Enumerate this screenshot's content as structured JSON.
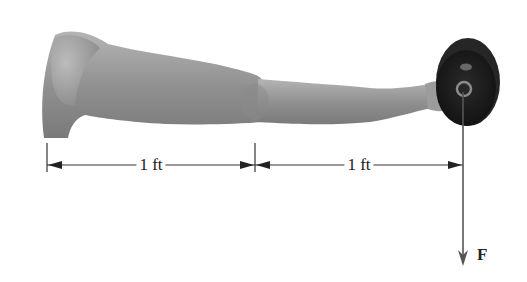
{
  "diagram": {
    "dimensions": [
      {
        "label": "1 ft",
        "from": "shoulder",
        "to": "elbow"
      },
      {
        "label": "1 ft",
        "from": "elbow",
        "to": "weight"
      }
    ],
    "force": {
      "label": "F",
      "direction": "down"
    },
    "colors": {
      "arm": "#9a9a9a",
      "arm_shadow": "#777777",
      "weight": "#1c1c1c",
      "lines": "#333333"
    }
  }
}
